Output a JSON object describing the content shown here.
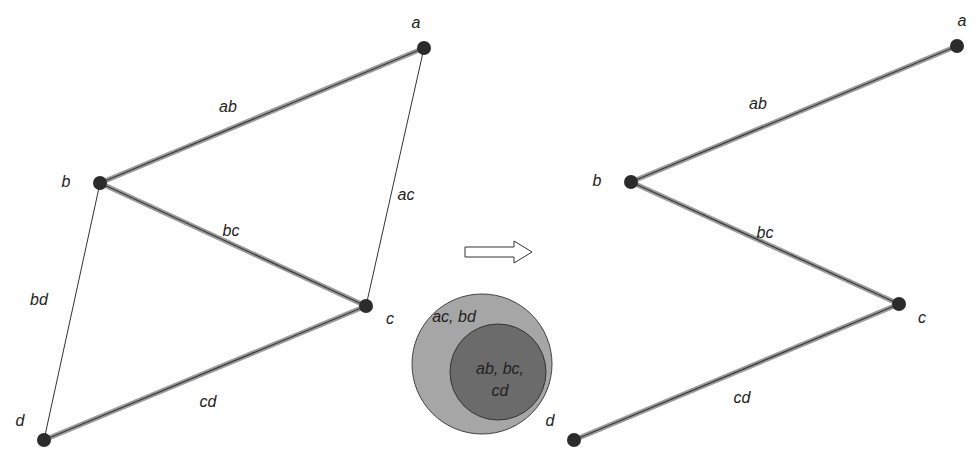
{
  "left_graph": {
    "nodes": [
      {
        "id": "a",
        "x": 424,
        "y": 48,
        "lx": 416,
        "ly": 24
      },
      {
        "id": "b",
        "x": 100,
        "y": 183,
        "lx": 66,
        "ly": 183
      },
      {
        "id": "c",
        "x": 366,
        "y": 306,
        "lx": 390,
        "ly": 320
      },
      {
        "id": "d",
        "x": 44,
        "y": 440,
        "lx": 20,
        "ly": 422
      }
    ],
    "edges": [
      {
        "id": "ab",
        "from": "a",
        "to": "b",
        "heavy": true,
        "lx": 228,
        "ly": 108
      },
      {
        "id": "bc",
        "from": "b",
        "to": "c",
        "heavy": true,
        "lx": 231,
        "ly": 232
      },
      {
        "id": "cd",
        "from": "c",
        "to": "d",
        "heavy": true,
        "lx": 208,
        "ly": 403
      },
      {
        "id": "ac",
        "from": "a",
        "to": "c",
        "heavy": false,
        "lx": 406,
        "ly": 196
      },
      {
        "id": "bd",
        "from": "b",
        "to": "d",
        "heavy": false,
        "lx": 39,
        "ly": 301
      }
    ]
  },
  "right_graph": {
    "nodes": [
      {
        "id": "a",
        "x": 957,
        "y": 46,
        "lx": 962,
        "ly": 22
      },
      {
        "id": "b",
        "x": 631,
        "y": 182,
        "lx": 597,
        "ly": 182
      },
      {
        "id": "c",
        "x": 899,
        "y": 304,
        "lx": 922,
        "ly": 319
      },
      {
        "id": "d",
        "x": 574,
        "y": 440,
        "lx": 550,
        "ly": 422
      }
    ],
    "edges": [
      {
        "id": "ab",
        "from": "a",
        "to": "b",
        "heavy": true,
        "lx": 758,
        "ly": 105
      },
      {
        "id": "bc",
        "from": "b",
        "to": "c",
        "heavy": true,
        "lx": 765,
        "ly": 234
      },
      {
        "id": "cd",
        "from": "c",
        "to": "d",
        "heavy": true,
        "lx": 742,
        "ly": 399
      }
    ]
  },
  "arrow": {
    "x1": 465,
    "x2": 532,
    "y": 252
  },
  "venn": {
    "outer": {
      "cx": 482,
      "cy": 364,
      "r": 70,
      "fill": "#a6a6a6",
      "label": "ac, bd",
      "lx": 454,
      "ly": 318
    },
    "inner": {
      "cx": 498,
      "cy": 372,
      "r": 48,
      "fill": "#6b6b6b",
      "label1": "ab, bc,",
      "label2": "cd",
      "lx": 500,
      "ly": 370,
      "ly2": 392
    }
  },
  "colors": {
    "node": "#2b2b2b",
    "heavy_edge": "#9c9c9c",
    "heavy_core": "#3a3a3a",
    "thin_edge": "#333333"
  }
}
